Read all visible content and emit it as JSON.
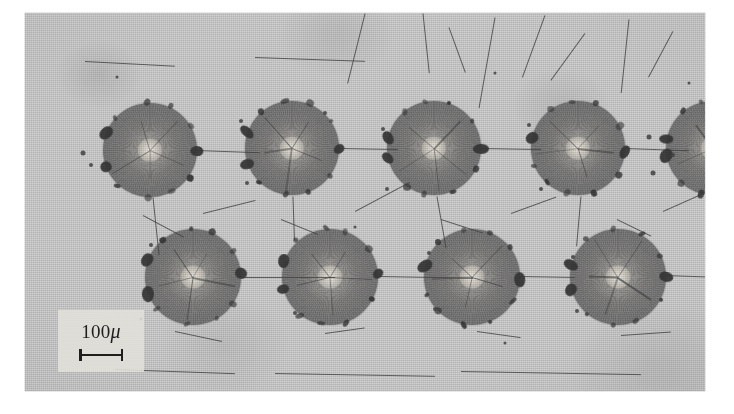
{
  "figure": {
    "kind": "photomicrograph",
    "background_color": "#cfcfcf",
    "plate": {
      "x": 25,
      "y": 13,
      "width": 680,
      "height": 378
    }
  },
  "scale_bar": {
    "value": "100",
    "unit": "μ",
    "label": "100μ",
    "bar_length_px": 44,
    "panel_color": "#e2e0da",
    "ink_color": "#1e1e1e"
  },
  "spots": {
    "rows": [
      {
        "name": "top-row",
        "center_y": 137,
        "items": [
          {
            "id": "top-1",
            "cx": 125,
            "cy": 137,
            "r": 47,
            "partial": false
          },
          {
            "id": "top-2",
            "cx": 267,
            "cy": 135,
            "r": 47,
            "partial": false
          },
          {
            "id": "top-3",
            "cx": 409,
            "cy": 135,
            "r": 47,
            "partial": false
          },
          {
            "id": "top-4",
            "cx": 553,
            "cy": 135,
            "r": 47,
            "partial": false
          },
          {
            "id": "top-5",
            "cx": 688,
            "cy": 135,
            "r": 47,
            "partial": true
          }
        ]
      },
      {
        "name": "bottom-row",
        "center_y": 264,
        "items": [
          {
            "id": "bot-1",
            "cx": 168,
            "cy": 264,
            "r": 48,
            "partial": false
          },
          {
            "id": "bot-2",
            "cx": 305,
            "cy": 264,
            "r": 48,
            "partial": false
          },
          {
            "id": "bot-3",
            "cx": 447,
            "cy": 264,
            "r": 48,
            "partial": false
          },
          {
            "id": "bot-4",
            "cx": 593,
            "cy": 264,
            "r": 48,
            "partial": false
          }
        ]
      }
    ]
  },
  "cracks": [
    {
      "x": 340,
      "y": 0,
      "len": 72,
      "angle": 104,
      "w": 1.1
    },
    {
      "x": 398,
      "y": 0,
      "len": 60,
      "angle": 84,
      "w": 1.0
    },
    {
      "x": 424,
      "y": 14,
      "len": 48,
      "angle": 70,
      "w": 0.9
    },
    {
      "x": 470,
      "y": 4,
      "len": 92,
      "angle": 100,
      "w": 1.0
    },
    {
      "x": 520,
      "y": 2,
      "len": 66,
      "angle": 110,
      "w": 0.9
    },
    {
      "x": 560,
      "y": 20,
      "len": 58,
      "angle": 126,
      "w": 0.9
    },
    {
      "x": 604,
      "y": 6,
      "len": 74,
      "angle": 96,
      "w": 0.9
    },
    {
      "x": 648,
      "y": 18,
      "len": 52,
      "angle": 118,
      "w": 0.8
    },
    {
      "x": 171,
      "y": 137,
      "len": 64,
      "angle": 2,
      "w": 1.3
    },
    {
      "x": 313,
      "y": 135,
      "len": 60,
      "angle": 1,
      "w": 1.3
    },
    {
      "x": 456,
      "y": 135,
      "len": 60,
      "angle": 1,
      "w": 1.3
    },
    {
      "x": 600,
      "y": 135,
      "len": 64,
      "angle": 2,
      "w": 1.2
    },
    {
      "x": 128,
      "y": 184,
      "len": 58,
      "angle": 84,
      "w": 1.0
    },
    {
      "x": 268,
      "y": 183,
      "len": 44,
      "angle": 88,
      "w": 0.9
    },
    {
      "x": 412,
      "y": 183,
      "len": 52,
      "angle": 80,
      "w": 0.9
    },
    {
      "x": 556,
      "y": 183,
      "len": 50,
      "angle": 95,
      "w": 0.9
    },
    {
      "x": 214,
      "y": 264,
      "len": 96,
      "angle": 0,
      "w": 1.3
    },
    {
      "x": 352,
      "y": 263,
      "len": 96,
      "angle": 1,
      "w": 1.2
    },
    {
      "x": 494,
      "y": 263,
      "len": 56,
      "angle": 1,
      "w": 1.2
    },
    {
      "x": 640,
      "y": 262,
      "len": 66,
      "angle": 2,
      "w": 1.3
    },
    {
      "x": 118,
      "y": 202,
      "len": 46,
      "angle": 28,
      "w": 0.9
    },
    {
      "x": 178,
      "y": 200,
      "len": 54,
      "angle": 346,
      "w": 0.9
    },
    {
      "x": 256,
      "y": 206,
      "len": 40,
      "angle": 22,
      "w": 0.8
    },
    {
      "x": 330,
      "y": 198,
      "len": 62,
      "angle": 332,
      "w": 0.9
    },
    {
      "x": 416,
      "y": 206,
      "len": 44,
      "angle": 18,
      "w": 0.8
    },
    {
      "x": 486,
      "y": 200,
      "len": 48,
      "angle": 340,
      "w": 0.8
    },
    {
      "x": 592,
      "y": 206,
      "len": 38,
      "angle": 26,
      "w": 0.8
    },
    {
      "x": 638,
      "y": 198,
      "len": 44,
      "angle": 336,
      "w": 0.8
    },
    {
      "x": 150,
      "y": 318,
      "len": 48,
      "angle": 12,
      "w": 0.8
    },
    {
      "x": 300,
      "y": 320,
      "len": 40,
      "angle": 352,
      "w": 0.8
    },
    {
      "x": 452,
      "y": 318,
      "len": 44,
      "angle": 8,
      "w": 0.8
    },
    {
      "x": 596,
      "y": 322,
      "len": 50,
      "angle": 356,
      "w": 0.8
    },
    {
      "x": 90,
      "y": 356,
      "len": 120,
      "angle": 2,
      "w": 0.7
    },
    {
      "x": 250,
      "y": 360,
      "len": 160,
      "angle": 1,
      "w": 0.7
    },
    {
      "x": 436,
      "y": 358,
      "len": 180,
      "angle": 1,
      "w": 0.7
    },
    {
      "x": 60,
      "y": 48,
      "len": 90,
      "angle": 3,
      "w": 0.6
    },
    {
      "x": 230,
      "y": 44,
      "len": 110,
      "angle": 2,
      "w": 0.6
    }
  ],
  "specks": [
    {
      "x": 58,
      "y": 140,
      "d": 5
    },
    {
      "x": 66,
      "y": 152,
      "d": 4
    },
    {
      "x": 216,
      "y": 108,
      "d": 4
    },
    {
      "x": 222,
      "y": 170,
      "d": 4
    },
    {
      "x": 300,
      "y": 100,
      "d": 4
    },
    {
      "x": 358,
      "y": 116,
      "d": 4
    },
    {
      "x": 362,
      "y": 176,
      "d": 4
    },
    {
      "x": 504,
      "y": 112,
      "d": 4
    },
    {
      "x": 516,
      "y": 176,
      "d": 4
    },
    {
      "x": 624,
      "y": 124,
      "d": 5
    },
    {
      "x": 628,
      "y": 160,
      "d": 5
    },
    {
      "x": 648,
      "y": 142,
      "d": 4
    },
    {
      "x": 126,
      "y": 232,
      "d": 4
    },
    {
      "x": 262,
      "y": 246,
      "d": 4
    },
    {
      "x": 270,
      "y": 300,
      "d": 4
    },
    {
      "x": 404,
      "y": 240,
      "d": 4
    },
    {
      "x": 410,
      "y": 296,
      "d": 4
    },
    {
      "x": 548,
      "y": 244,
      "d": 4
    },
    {
      "x": 552,
      "y": 298,
      "d": 4
    },
    {
      "x": 116,
      "y": 306,
      "d": 3
    },
    {
      "x": 480,
      "y": 330,
      "d": 3
    },
    {
      "x": 330,
      "y": 214,
      "d": 3
    },
    {
      "x": 92,
      "y": 64,
      "d": 3
    },
    {
      "x": 470,
      "y": 60,
      "d": 3
    },
    {
      "x": 664,
      "y": 70,
      "d": 3
    }
  ]
}
